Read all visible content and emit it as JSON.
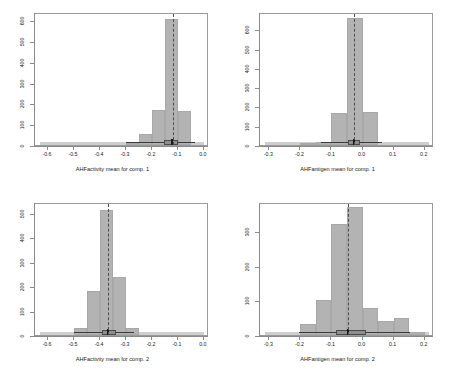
{
  "figure": {
    "layout": "2x2 grid of histograms",
    "panel_order": [
      "top-left",
      "top-right",
      "bottom-left",
      "bottom-right"
    ],
    "bar_color": "#b3b3b3",
    "refline_color": "#4d4d4d"
  },
  "chart_data": [
    {
      "type": "bar",
      "panel": "top-left",
      "title": "",
      "xlabel": "AHFactivity mean for comp. 1",
      "ylabel": "",
      "xlim": [
        -0.65,
        0.02
      ],
      "ylim": [
        0,
        640
      ],
      "xticks": [
        "-0.6",
        "-0.5",
        "-0.4",
        "-0.3",
        "-0.2",
        "-0.1",
        "0.0"
      ],
      "xtick_values": [
        -0.6,
        -0.5,
        -0.4,
        -0.3,
        -0.2,
        -0.1,
        0.0
      ],
      "yticks": [
        "0",
        "100",
        "200",
        "300",
        "400",
        "500",
        "600"
      ],
      "ytick_values": [
        0,
        100,
        200,
        300,
        400,
        500,
        600
      ],
      "grid": false,
      "bin_edges": [
        -0.3,
        -0.25,
        -0.2,
        -0.15,
        -0.1,
        -0.05
      ],
      "values": [
        12,
        55,
        168,
        608,
        166
      ],
      "refline_x": -0.118,
      "boxplot": {
        "min": -0.3,
        "q1": -0.155,
        "median": -0.122,
        "q3": -0.098,
        "max": -0.035
      }
    },
    {
      "type": "bar",
      "panel": "top-right",
      "title": "",
      "xlabel": "AHFantigen mean for comp. 1",
      "ylabel": "",
      "xlim": [
        -0.33,
        0.23
      ],
      "ylim": [
        0,
        690
      ],
      "xticks": [
        "-0.3",
        "-0.2",
        "-0.1",
        "0.0",
        "0.1",
        "0.2"
      ],
      "xtick_values": [
        -0.3,
        -0.2,
        -0.1,
        0.0,
        0.1,
        0.2
      ],
      "yticks": [
        "0",
        "100",
        "200",
        "300",
        "400",
        "500",
        "600"
      ],
      "ytick_values": [
        0,
        100,
        200,
        300,
        400,
        500,
        600
      ],
      "grid": false,
      "bin_edges": [
        -0.2,
        -0.15,
        -0.1,
        -0.05,
        0.0,
        0.05
      ],
      "values": [
        6,
        18,
        168,
        660,
        170
      ],
      "refline_x": -0.026,
      "boxplot": {
        "min": -0.135,
        "q1": -0.047,
        "median": -0.027,
        "q3": -0.008,
        "max": 0.062
      }
    },
    {
      "type": "bar",
      "panel": "bottom-left",
      "title": "",
      "xlabel": "AHFactivity mean for comp. 2",
      "ylabel": "",
      "xlim": [
        -0.65,
        0.02
      ],
      "ylim": [
        0,
        545
      ],
      "xticks": [
        "-0.6",
        "-0.5",
        "-0.4",
        "-0.3",
        "-0.2",
        "-0.1",
        "0.0"
      ],
      "xtick_values": [
        -0.6,
        -0.5,
        -0.4,
        -0.3,
        -0.2,
        -0.1,
        0.0
      ],
      "yticks": [
        "0",
        "100",
        "200",
        "300",
        "400",
        "500"
      ],
      "ytick_values": [
        0,
        100,
        200,
        300,
        400,
        500
      ],
      "grid": false,
      "bin_edges": [
        -0.5,
        -0.45,
        -0.4,
        -0.35,
        -0.3,
        -0.25
      ],
      "values": [
        28,
        182,
        512,
        238,
        30
      ],
      "refline_x": -0.368,
      "boxplot": {
        "min": -0.5,
        "q1": -0.392,
        "median": -0.368,
        "q3": -0.338,
        "max": -0.268
      }
    },
    {
      "type": "bar",
      "panel": "bottom-right",
      "title": "",
      "xlabel": "AHFantigen mean for comp. 2",
      "ylabel": "",
      "xlim": [
        -0.33,
        0.23
      ],
      "ylim": [
        0,
        385
      ],
      "xticks": [
        "-0.3",
        "-0.2",
        "-0.1",
        "0.0",
        "0.1",
        "0.2"
      ],
      "xtick_values": [
        -0.3,
        -0.2,
        -0.1,
        0.0,
        0.1,
        0.2
      ],
      "yticks": [
        "0",
        "100",
        "200",
        "300"
      ],
      "ytick_values": [
        0,
        100,
        200,
        300
      ],
      "grid": false,
      "bin_edges": [
        -0.2,
        -0.15,
        -0.1,
        -0.05,
        0.0,
        0.05,
        0.1,
        0.15,
        0.2
      ],
      "values": [
        32,
        100,
        322,
        372,
        78,
        40,
        48,
        10
      ],
      "refline_x": -0.046,
      "boxplot": {
        "min": -0.205,
        "q1": -0.086,
        "median": -0.046,
        "q3": 0.012,
        "max": 0.152
      }
    }
  ]
}
